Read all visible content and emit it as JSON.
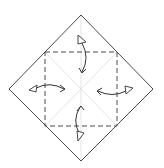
{
  "diagram": {
    "type": "origami-fold-step",
    "colors": {
      "background": "#ffffff",
      "outline": "#4a4a4a",
      "crease": "#dcdcdc",
      "arrow": "#333333"
    },
    "paper": {
      "shape": "diamond",
      "vertices": {
        "top": [
          81,
          15
        ],
        "right": [
          153,
          89
        ],
        "bottom": [
          81,
          161
        ],
        "left": [
          9,
          89
        ]
      }
    },
    "fold_lines": {
      "style": "dashed",
      "square": {
        "x1": 45,
        "y1": 52,
        "x2": 117,
        "y2": 126
      }
    },
    "creases": [
      {
        "name": "vertical",
        "from": [
          81,
          15
        ],
        "to": [
          81,
          161
        ]
      },
      {
        "name": "diagonal-1",
        "from": [
          45,
          52
        ],
        "to": [
          117,
          126
        ]
      },
      {
        "name": "diagonal-2",
        "from": [
          117,
          52
        ],
        "to": [
          45,
          126
        ]
      }
    ],
    "arrows": [
      {
        "name": "top-fold-unfold",
        "direction": "fold to center and back",
        "from": "top corner"
      },
      {
        "name": "left-fold-unfold",
        "direction": "fold to center and back",
        "from": "left corner"
      },
      {
        "name": "right-fold-unfold",
        "direction": "fold to center and back",
        "from": "right corner"
      },
      {
        "name": "bottom-fold-unfold",
        "direction": "fold to center and back",
        "from": "bottom corner"
      }
    ]
  }
}
